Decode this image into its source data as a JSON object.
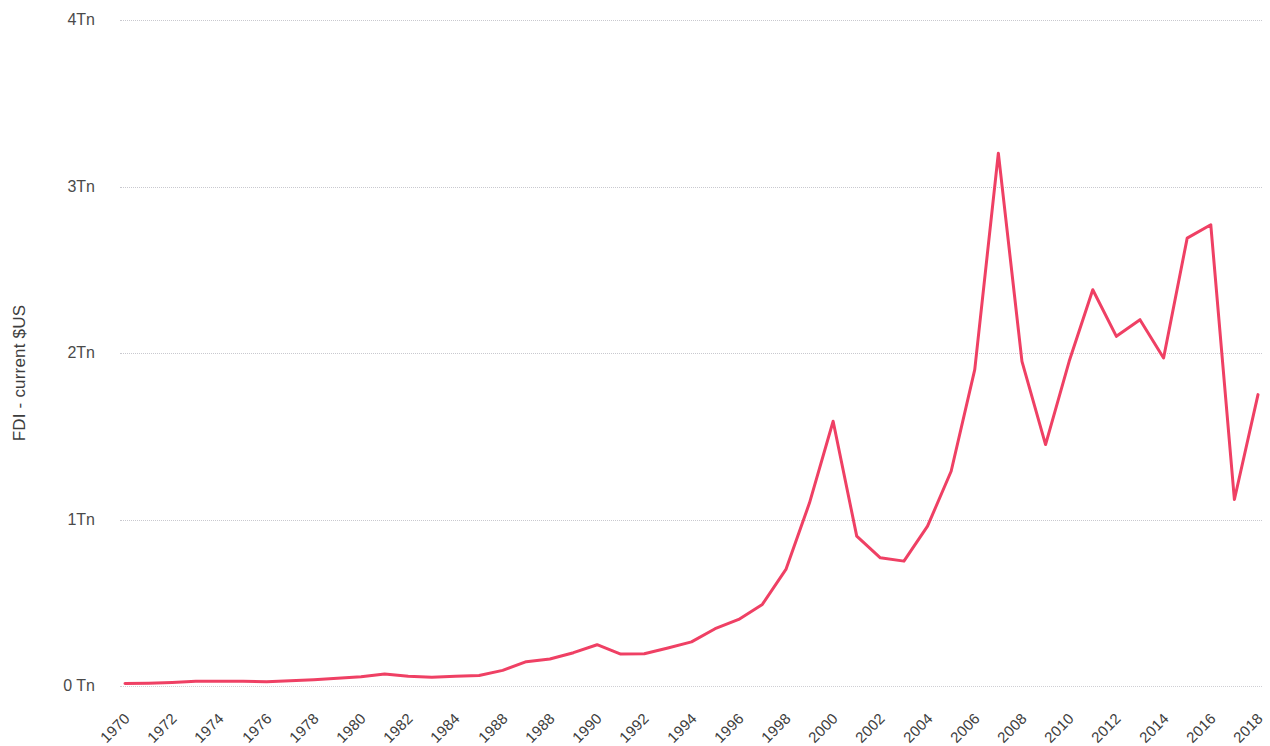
{
  "chart_data": {
    "type": "line",
    "title": "",
    "subtitle": "",
    "xlabel": "",
    "ylabel": "FDI - current $US",
    "legend": [],
    "legend_position": "none",
    "grid": true,
    "units": "Tn (trillions of current US dollars)",
    "series_color": "#ef4064",
    "xlim": [
      1970,
      2018
    ],
    "ylim": [
      0,
      4
    ],
    "y_ticks": [
      0,
      1,
      2,
      3,
      4
    ],
    "y_tick_labels": [
      "0 Tn",
      "1Tn",
      "2Tn",
      "3Tn",
      "4Tn"
    ],
    "x_tick_labels": [
      "1970",
      "1972",
      "1974",
      "1976",
      "1978",
      "1980",
      "1982",
      "1984",
      "1988",
      "1988",
      "1990",
      "1992",
      "1994",
      "1996",
      "1998",
      "2000",
      "2002",
      "2004",
      "2006",
      "2008",
      "2010",
      "2012",
      "2014",
      "2016",
      "2018"
    ],
    "x": [
      1970,
      1971,
      1972,
      1973,
      1974,
      1975,
      1976,
      1977,
      1978,
      1979,
      1980,
      1981,
      1982,
      1983,
      1984,
      1985,
      1986,
      1987,
      1988,
      1989,
      1990,
      1991,
      1992,
      1993,
      1994,
      1995,
      1996,
      1997,
      1998,
      1999,
      2000,
      2001,
      2002,
      2003,
      2004,
      2005,
      2006,
      2007,
      2008,
      2009,
      2010,
      2011,
      2012,
      2013,
      2014,
      2015,
      2016,
      2017,
      2018
    ],
    "values": [
      0.015,
      0.017,
      0.021,
      0.028,
      0.029,
      0.029,
      0.025,
      0.031,
      0.038,
      0.046,
      0.055,
      0.072,
      0.058,
      0.053,
      0.058,
      0.063,
      0.094,
      0.146,
      0.162,
      0.2,
      0.248,
      0.192,
      0.194,
      0.228,
      0.265,
      0.344,
      0.4,
      0.49,
      0.7,
      1.1,
      1.59,
      0.9,
      0.77,
      0.75,
      0.96,
      1.29,
      1.9,
      3.2,
      1.95,
      1.45,
      1.95,
      2.38,
      2.1,
      2.2,
      1.97,
      2.69,
      2.77,
      1.12,
      1.75
    ],
    "series": [
      {
        "name": "FDI - current $US",
        "color": "#ef4064",
        "values": [
          0.015,
          0.017,
          0.021,
          0.028,
          0.029,
          0.029,
          0.025,
          0.031,
          0.038,
          0.046,
          0.055,
          0.072,
          0.058,
          0.053,
          0.058,
          0.063,
          0.094,
          0.146,
          0.162,
          0.2,
          0.248,
          0.192,
          0.194,
          0.228,
          0.265,
          0.344,
          0.4,
          0.49,
          0.7,
          1.1,
          1.59,
          0.9,
          0.77,
          0.75,
          0.96,
          1.29,
          1.9,
          3.2,
          1.95,
          1.45,
          1.95,
          2.38,
          2.1,
          2.2,
          1.97,
          2.69,
          2.77,
          1.12,
          1.75
        ]
      }
    ],
    "annotations": []
  },
  "layout": {
    "plot_left": 125,
    "plot_right": 1258,
    "plot_top": 20,
    "plot_bottom": 686
  }
}
